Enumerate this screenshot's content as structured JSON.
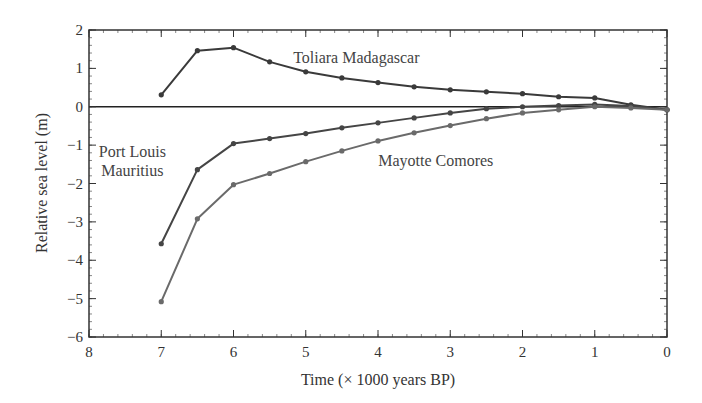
{
  "chart_data": {
    "type": "line",
    "title": "",
    "xlabel": "Time (× 1000 years BP)",
    "ylabel": "Relative sea level (m)",
    "xlim": [
      8,
      0
    ],
    "ylim": [
      -6,
      2
    ],
    "x_reversed": true,
    "grid": false,
    "legend": "inline labels",
    "x_ticks": [
      8,
      7,
      6,
      5,
      4,
      3,
      2,
      1,
      0
    ],
    "y_ticks": [
      2,
      1,
      0,
      -1,
      -2,
      -3,
      -4,
      -5,
      -6
    ],
    "x_tick_labels": [
      "8",
      "7",
      "6",
      "5",
      "4",
      "3",
      "2",
      "1",
      "0"
    ],
    "y_tick_labels": [
      "2",
      "1",
      "0",
      "−1",
      "−2",
      "−3",
      "−4",
      "−5",
      "−6"
    ],
    "reference_line": {
      "y": 0
    },
    "x": [
      7,
      6.5,
      6,
      5.5,
      5,
      4.5,
      4,
      3.5,
      3,
      2.5,
      2,
      1.5,
      1,
      0.5,
      0
    ],
    "series": [
      {
        "name": "Toliara Madagascar",
        "color": "#3a3a3a",
        "label_pos": [
          4.3,
          1.15
        ],
        "values": [
          0.31,
          1.46,
          1.54,
          1.17,
          0.91,
          0.75,
          0.63,
          0.52,
          0.44,
          0.39,
          0.34,
          0.26,
          0.23,
          0.05,
          -0.08
        ]
      },
      {
        "name": "Port Louis Mauritius",
        "label_lines": [
          "Port Louis",
          "Mauritius"
        ],
        "color": "#454545",
        "label_pos": [
          7.4,
          -1.3
        ],
        "values": [
          -3.57,
          -1.64,
          -0.96,
          -0.83,
          -0.7,
          -0.55,
          -0.42,
          -0.29,
          -0.16,
          -0.05,
          0.0,
          0.03,
          0.06,
          0.02,
          -0.08
        ]
      },
      {
        "name": "Mayotte Comores",
        "color": "#6a6a6a",
        "label_pos": [
          3.2,
          -1.55
        ],
        "values": [
          -5.08,
          -2.92,
          -2.03,
          -1.74,
          -1.43,
          -1.15,
          -0.89,
          -0.68,
          -0.49,
          -0.31,
          -0.16,
          -0.08,
          0.0,
          -0.03,
          -0.08
        ]
      }
    ]
  }
}
